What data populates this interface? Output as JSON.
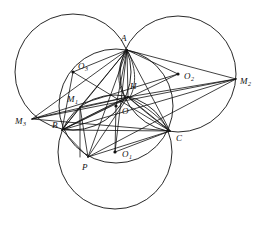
{
  "figure": {
    "background_color": "#ffffff",
    "stroke_color": "#111111",
    "width": 261,
    "height": 227
  },
  "labels": {
    "A": {
      "text": "A",
      "x": 121,
      "y": 41
    },
    "B": {
      "text": "B",
      "x": 52,
      "y": 128
    },
    "C": {
      "text": "C",
      "x": 176,
      "y": 141
    },
    "P": {
      "text": "P",
      "x": 82,
      "y": 170
    },
    "H": {
      "text": "H",
      "x": 130,
      "y": 89
    },
    "O": {
      "text": "O",
      "x": 122,
      "y": 114
    },
    "O1": {
      "text": "O",
      "sub": "1",
      "x": 122,
      "y": 157
    },
    "O2": {
      "text": "O",
      "sub": "2",
      "x": 184,
      "y": 79
    },
    "O3": {
      "text": "O",
      "sub": "3",
      "x": 78,
      "y": 69
    },
    "M1": {
      "text": "M",
      "sub": "1",
      "x": 67,
      "y": 102
    },
    "M2": {
      "text": "M",
      "sub": "2",
      "x": 240,
      "y": 84
    },
    "M3": {
      "text": "M",
      "sub": "3",
      "x": 15,
      "y": 124
    }
  },
  "points": {
    "A": {
      "x": 127,
      "y": 50
    },
    "B": {
      "x": 62,
      "y": 130
    },
    "C": {
      "x": 170,
      "y": 131
    },
    "P": {
      "x": 88,
      "y": 157
    },
    "H": {
      "x": 128,
      "y": 97
    },
    "O": {
      "x": 116,
      "y": 106
    },
    "O1": {
      "x": 115,
      "y": 152
    },
    "O2": {
      "x": 178,
      "y": 74
    },
    "O3": {
      "x": 73,
      "y": 72
    },
    "M1": {
      "x": 80,
      "y": 107
    },
    "M2": {
      "x": 236,
      "y": 79
    },
    "M3": {
      "x": 32,
      "y": 119
    }
  },
  "dots": [
    {
      "name": "center-O",
      "x": 116,
      "y": 106,
      "r": 1.6
    },
    {
      "name": "center-O1",
      "x": 115,
      "y": 152,
      "r": 1.6
    },
    {
      "name": "center-O2",
      "x": 178,
      "y": 74,
      "r": 1.6
    },
    {
      "name": "center-O3",
      "x": 73,
      "y": 72,
      "r": 1.6
    }
  ],
  "circles": [
    {
      "name": "circumcircle-ABC",
      "cx": 116,
      "cy": 106,
      "r": 57
    },
    {
      "name": "circle-O1-bottom",
      "cx": 115,
      "cy": 152,
      "r": 57
    },
    {
      "name": "circle-O2-right",
      "cx": 178,
      "cy": 74,
      "r": 58
    },
    {
      "name": "circle-O3-left",
      "cx": 73,
      "cy": 72,
      "r": 58
    }
  ],
  "segments": [
    {
      "name": "side-AB",
      "x1": 127,
      "y1": 50,
      "x2": 62,
      "y2": 130
    },
    {
      "name": "side-BC",
      "x1": 62,
      "y1": 130,
      "x2": 170,
      "y2": 131
    },
    {
      "name": "side-CA",
      "x1": 170,
      "y1": 131,
      "x2": 127,
      "y2": 50
    },
    {
      "name": "A-to-H",
      "x1": 127,
      "y1": 50,
      "x2": 128,
      "y2": 97
    },
    {
      "name": "A-to-O",
      "x1": 127,
      "y1": 50,
      "x2": 116,
      "y2": 106
    },
    {
      "name": "A-to-P",
      "x1": 127,
      "y1": 50,
      "x2": 88,
      "y2": 157
    },
    {
      "name": "A-to-O1",
      "x1": 127,
      "y1": 50,
      "x2": 115,
      "y2": 152
    },
    {
      "name": "A-to-M1",
      "x1": 127,
      "y1": 50,
      "x2": 80,
      "y2": 107
    },
    {
      "name": "A-to-M2",
      "x1": 127,
      "y1": 50,
      "x2": 236,
      "y2": 79
    },
    {
      "name": "A-to-M3",
      "x1": 127,
      "y1": 50,
      "x2": 32,
      "y2": 119
    },
    {
      "name": "A-to-O3",
      "x1": 127,
      "y1": 50,
      "x2": 73,
      "y2": 72
    },
    {
      "name": "A-to-O2",
      "x1": 127,
      "y1": 50,
      "x2": 178,
      "y2": 74
    },
    {
      "name": "H-to-M3",
      "x1": 128,
      "y1": 97,
      "x2": 32,
      "y2": 119
    },
    {
      "name": "H-to-M2",
      "x1": 128,
      "y1": 97,
      "x2": 236,
      "y2": 79
    },
    {
      "name": "H-to-B",
      "x1": 128,
      "y1": 97,
      "x2": 62,
      "y2": 130
    },
    {
      "name": "H-to-C",
      "x1": 128,
      "y1": 97,
      "x2": 170,
      "y2": 131
    },
    {
      "name": "H-to-P",
      "x1": 128,
      "y1": 97,
      "x2": 88,
      "y2": 157
    },
    {
      "name": "H-to-M1",
      "x1": 128,
      "y1": 97,
      "x2": 80,
      "y2": 107
    },
    {
      "name": "O-to-O1",
      "x1": 116,
      "y1": 106,
      "x2": 115,
      "y2": 152
    },
    {
      "name": "O3-to-M1-B",
      "x1": 73,
      "y1": 72,
      "x2": 62,
      "y2": 130
    },
    {
      "name": "O3-to-C",
      "x1": 73,
      "y1": 72,
      "x2": 170,
      "y2": 131
    },
    {
      "name": "O2-to-M3",
      "x1": 178,
      "y1": 74,
      "x2": 32,
      "y2": 119
    },
    {
      "name": "O2-to-B",
      "x1": 178,
      "y1": 74,
      "x2": 62,
      "y2": 130
    },
    {
      "name": "M3-to-C",
      "x1": 32,
      "y1": 119,
      "x2": 170,
      "y2": 131
    },
    {
      "name": "M3-to-M2",
      "x1": 32,
      "y1": 119,
      "x2": 236,
      "y2": 79
    },
    {
      "name": "M2-to-B",
      "x1": 236,
      "y1": 79,
      "x2": 62,
      "y2": 130
    },
    {
      "name": "M2-to-P",
      "x1": 236,
      "y1": 79,
      "x2": 88,
      "y2": 157
    },
    {
      "name": "M1-to-P",
      "x1": 80,
      "y1": 107,
      "x2": 88,
      "y2": 157
    },
    {
      "name": "M1-vertical-drop",
      "x1": 80,
      "y1": 107,
      "x2": 80,
      "y2": 157
    },
    {
      "name": "B-to-P",
      "x1": 62,
      "y1": 130,
      "x2": 88,
      "y2": 157
    },
    {
      "name": "P-to-C",
      "x1": 88,
      "y1": 157,
      "x2": 170,
      "y2": 131
    },
    {
      "name": "B-to-M1",
      "x1": 62,
      "y1": 130,
      "x2": 80,
      "y2": 107
    },
    {
      "name": "O1-to-C",
      "x1": 115,
      "y1": 152,
      "x2": 170,
      "y2": 131
    }
  ],
  "arcs": [
    {
      "name": "arc-A-to-H-left",
      "d": "M 127 50 C 117 65 116 84 125 97"
    },
    {
      "name": "arc-A-to-H-right",
      "d": "M 127 50 C 136 66 137 84 130 97"
    },
    {
      "name": "arc-B-to-H",
      "d": "M 62 130 C 80 120 108 106 128 97"
    },
    {
      "name": "arc-C-to-H",
      "d": "M 170 131 C 158 122 140 108 128 97"
    },
    {
      "name": "arc-H-to-C-low",
      "d": "M 128 97 C 146 106 162 119 170 131"
    }
  ]
}
